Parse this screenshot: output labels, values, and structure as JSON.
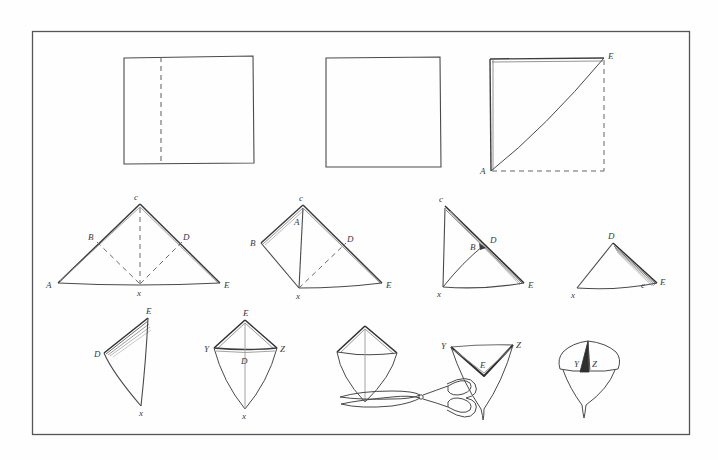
{
  "page": {
    "background_color": "#fefefe",
    "ink_color": "#4a4a4a",
    "ink_color_dark": "#2b2b2b",
    "border": {
      "x": 32,
      "y": 31,
      "width": 658,
      "height": 404,
      "stroke": "#555555",
      "stroke_width": 1.2
    }
  },
  "rows": [
    {
      "name": "row-1-sheet-folding",
      "figures": [
        {
          "name": "figure-1-rectangle-with-fold-line",
          "shape": "rectangle",
          "labels": [],
          "fold_line": "vertical-dashed"
        },
        {
          "name": "figure-2-folded-square",
          "shape": "square",
          "labels": [],
          "fold_line": "none"
        },
        {
          "name": "figure-3-square-with-diagonal",
          "shape": "square",
          "labels": [
            "A",
            "E"
          ],
          "fold_line": "diagonal-A-to-E"
        }
      ]
    },
    {
      "name": "row-2-triangle-steps",
      "figures": [
        {
          "name": "figure-4-triangle-ACE",
          "labels": [
            "A",
            "B",
            "C",
            "D",
            "E",
            "X"
          ]
        },
        {
          "name": "figure-5-kite-BCDEX",
          "labels": [
            "A",
            "B",
            "C",
            "D",
            "E",
            "X"
          ]
        },
        {
          "name": "figure-6-triangle-CXE",
          "labels": [
            "B",
            "C",
            "D",
            "E",
            "X"
          ]
        },
        {
          "name": "figure-7-small-triangle-DXE",
          "labels": [
            "C",
            "D",
            "E",
            "X"
          ]
        }
      ]
    },
    {
      "name": "row-3-final-steps",
      "figures": [
        {
          "name": "figure-8-narrow-triangle-DEX",
          "labels": [
            "D",
            "E",
            "X"
          ]
        },
        {
          "name": "figure-9-kite-EYZX",
          "labels": [
            "D",
            "E",
            "X",
            "Y",
            "Z"
          ]
        },
        {
          "name": "figure-10-kite-with-scissors",
          "labels": [],
          "tool": "scissors"
        },
        {
          "name": "figure-11-inverted-triangle-YEZ",
          "labels": [
            "E",
            "Y",
            "Z"
          ]
        },
        {
          "name": "figure-12-finished-form-YZ",
          "labels": [
            "Y",
            "Z"
          ]
        }
      ]
    }
  ],
  "labels": {
    "A": "A",
    "A_lower": "A",
    "B": "B",
    "C": "C",
    "C_lower": "c",
    "D": "D",
    "E": "E",
    "X": "x",
    "Y": "Y",
    "Z": "Z"
  }
}
